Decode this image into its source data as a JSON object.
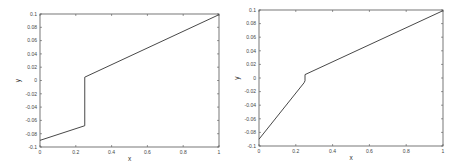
{
  "chart_data": [
    {
      "type": "line",
      "title": "",
      "xlabel": "x",
      "ylabel": "y",
      "xlim": [
        0,
        1
      ],
      "ylim": [
        -0.1,
        0.1
      ],
      "grid": false,
      "legend": null,
      "x_ticks": [
        "0",
        "0.2",
        "0.4",
        "0.6",
        "0.8",
        "1"
      ],
      "y_ticks": [
        "-0.1",
        "-0.08",
        "-0.06",
        "-0.04",
        "-0.02",
        "0",
        "0.02",
        "0.04",
        "0.06",
        "0.08",
        "0.1"
      ],
      "series": [
        {
          "name": "solution",
          "x": [
            0,
            0.25,
            0.25,
            1
          ],
          "y": [
            -0.09,
            -0.068,
            0.005,
            0.099
          ]
        }
      ],
      "frame": {
        "left": 40,
        "top": 14,
        "right": 219,
        "bottom": 147
      }
    },
    {
      "type": "line",
      "title": "",
      "xlabel": "x",
      "ylabel": "y",
      "xlim": [
        0,
        1
      ],
      "ylim": [
        -0.1,
        0.1
      ],
      "grid": false,
      "legend": null,
      "x_ticks": [
        "0",
        "0.2",
        "0.4",
        "0.6",
        "0.8",
        "1"
      ],
      "y_ticks": [
        "-0.1",
        "-0.08",
        "-0.06",
        "-0.04",
        "-0.02",
        "0",
        "0.02",
        "0.04",
        "0.06",
        "0.08",
        "0.1"
      ],
      "series": [
        {
          "name": "solution",
          "x": [
            0,
            0.245,
            0.25,
            0.25,
            1
          ],
          "y": [
            -0.09,
            -0.007,
            -0.004,
            0.005,
            0.099
          ]
        }
      ],
      "frame": {
        "left": 259,
        "top": 10,
        "right": 443,
        "bottom": 146
      }
    }
  ],
  "colors": {
    "axis": "#555555",
    "line": "#333333",
    "text": "#444444"
  }
}
